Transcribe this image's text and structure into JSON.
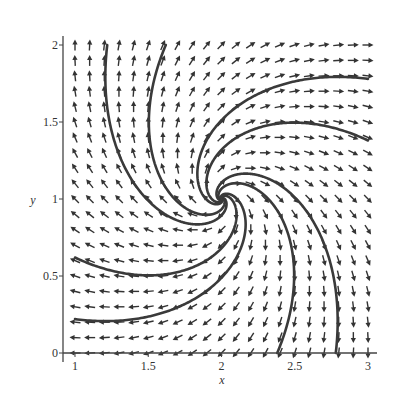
{
  "chart_data": {
    "type": "vector_field",
    "title": "",
    "xlabel": "x",
    "ylabel": "y",
    "xlim": [
      1,
      3
    ],
    "ylim": [
      0,
      2
    ],
    "xticks": [
      1,
      1.5,
      2,
      2.5,
      3
    ],
    "xtick_labels": [
      "1",
      "1.5",
      "2",
      "2.5",
      "3"
    ],
    "yticks": [
      0,
      0.5,
      1,
      1.5,
      2
    ],
    "ytick_labels": [
      "0",
      "0.5",
      "1",
      "1.5",
      "2"
    ],
    "grid": false,
    "legend": null,
    "field": {
      "description": "dx/dt = (x-2) + (y-1), dy/dt = -(x-2) + (y-1); unstable spiral source at (2,1), clockwise rotation",
      "equilibrium": [
        2,
        1
      ],
      "arrow_grid": {
        "x_start": 1,
        "x_end": 3,
        "x_step": 0.1,
        "y_start": 0,
        "y_end": 2,
        "y_step": 0.1
      },
      "arrows_normalized": true
    },
    "trajectories": [
      {
        "exit_point": [
          1.22,
          2.0
        ]
      },
      {
        "exit_point": [
          1.62,
          2.0
        ]
      },
      {
        "exit_point": [
          3.0,
          1.78
        ]
      },
      {
        "exit_point": [
          3.0,
          1.38
        ]
      },
      {
        "exit_point": [
          2.78,
          0.0
        ]
      },
      {
        "exit_point": [
          2.38,
          0.0
        ]
      },
      {
        "exit_point": [
          1.0,
          0.22
        ]
      },
      {
        "exit_point": [
          1.0,
          0.62
        ]
      }
    ]
  },
  "colors": {
    "axis": "#444444",
    "arrow": "#333333",
    "trajectory": "#3a3a3a",
    "background": "#ffffff"
  }
}
